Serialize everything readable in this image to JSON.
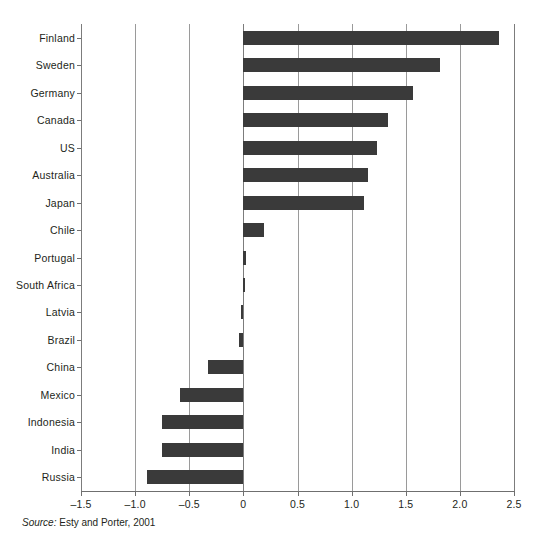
{
  "chart_data": {
    "type": "bar",
    "orientation": "horizontal",
    "title": "",
    "subtitle": "",
    "xlabel": "",
    "ylabel": "",
    "xlim": [
      -1.5,
      2.5
    ],
    "xticks": [
      -1.5,
      -1.0,
      -0.5,
      0,
      0.5,
      1.0,
      1.5,
      2.0,
      2.5
    ],
    "xtick_labels": [
      "–1.5",
      "–1.0",
      "–0.5",
      "0",
      "0.5",
      "1.0",
      "1.5",
      "2.0",
      "2.5"
    ],
    "grid": true,
    "grid_axis": "x",
    "legend": null,
    "bar_color": "#3a3a3a",
    "categories": [
      "Finland",
      "Sweden",
      "Germany",
      "Canada",
      "US",
      "Australia",
      "Japan",
      "Chile",
      "Portugal",
      "South Africa",
      "Latvia",
      "Brazil",
      "China",
      "Mexico",
      "Indonesia",
      "India",
      "Russia"
    ],
    "values": [
      2.36,
      1.82,
      1.57,
      1.34,
      1.23,
      1.15,
      1.11,
      0.19,
      0.02,
      0.01,
      -0.02,
      -0.04,
      -0.33,
      -0.59,
      -0.75,
      -0.75,
      -0.89
    ]
  },
  "source": {
    "label": "Source:",
    "text": "Esty and Porter, 2001"
  }
}
